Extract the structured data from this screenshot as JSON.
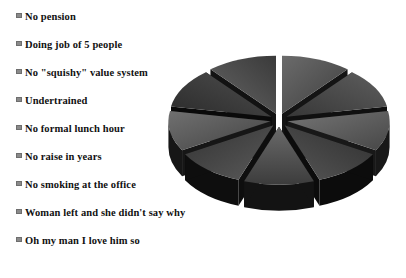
{
  "chart_data": {
    "type": "pie",
    "title": "",
    "subtitle": "",
    "xlabel": "",
    "ylabel": "",
    "grid": false,
    "legend_position": "left",
    "exploded": true,
    "three_d": true,
    "categories": [
      "No pension",
      "Doing job of 5 people",
      "No \"squishy\" value system",
      "Undertrained",
      "No formal lunch hour",
      "No raise in years",
      "No smoking at the office",
      "Woman left and she didn't say why",
      "Oh my man I love him so"
    ],
    "values": [
      11.1,
      11.1,
      11.1,
      11.1,
      11.1,
      11.1,
      11.1,
      11.1,
      11.1
    ],
    "slice_colors": [
      "#585858",
      "#4a4a4a",
      "#606060",
      "#3f3f3f",
      "#555555",
      "#464646",
      "#5c5c5c",
      "#3a3a3a",
      "#515151"
    ],
    "side_colors": [
      "#141414",
      "#101010",
      "#181818",
      "#0c0c0c",
      "#131313",
      "#0e0e0e",
      "#161616",
      "#0a0a0a",
      "#121212"
    ]
  },
  "legend": {
    "marker_color": "#8a8a8a",
    "marker_border": "#6e6e6e",
    "text_color": "#111111",
    "items": [
      {
        "label": "No pension"
      },
      {
        "label": "Doing job of 5 people"
      },
      {
        "label": "No \"squishy\" value system"
      },
      {
        "label": "Undertrained"
      },
      {
        "label": "No formal lunch hour"
      },
      {
        "label": "No raise in years"
      },
      {
        "label": "No smoking at the office"
      },
      {
        "label": "Woman left and she didn't say why"
      },
      {
        "label": "Oh my man I love him so"
      }
    ]
  },
  "canvas": {
    "background": "#ffffff",
    "width": 406,
    "height": 278
  }
}
